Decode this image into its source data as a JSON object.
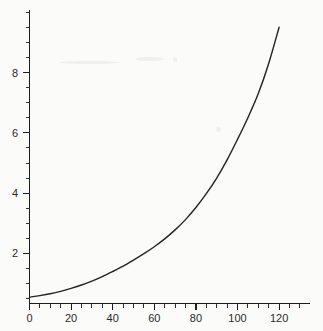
{
  "chart_data": {
    "type": "line",
    "title": "",
    "subtitle": "",
    "xlabel": "",
    "ylabel": "",
    "xlim": [
      0,
      122
    ],
    "ylim": [
      0.4,
      9.7
    ],
    "grid": false,
    "legend": null,
    "xticks": [
      0,
      20,
      40,
      60,
      80,
      100,
      120
    ],
    "xtick_labels": [
      "0",
      "20",
      "40",
      "60",
      "80",
      "100",
      "120"
    ],
    "x_minor_tick_step": 5,
    "yticks": [
      2,
      4,
      6,
      8
    ],
    "ytick_labels": [
      "2",
      "4",
      "6",
      "8"
    ],
    "y_minor_tick_step": 0.5,
    "series": [
      {
        "name": "curve",
        "color": "#262626",
        "x": [
          0,
          5,
          10,
          15,
          20,
          25,
          30,
          35,
          40,
          45,
          50,
          55,
          60,
          65,
          70,
          75,
          80,
          85,
          90,
          95,
          100,
          105,
          110,
          115,
          120
        ],
        "y": [
          0.55,
          0.6,
          0.66,
          0.74,
          0.84,
          0.95,
          1.08,
          1.23,
          1.4,
          1.58,
          1.78,
          1.99,
          2.22,
          2.48,
          2.78,
          3.12,
          3.52,
          3.98,
          4.5,
          5.1,
          5.78,
          6.5,
          7.3,
          8.3,
          9.5
        ]
      }
    ]
  },
  "figure": {
    "background_color": "#fbfbfa",
    "axis_color": "#1d1d1d",
    "text_color": "#2a2a2a"
  }
}
